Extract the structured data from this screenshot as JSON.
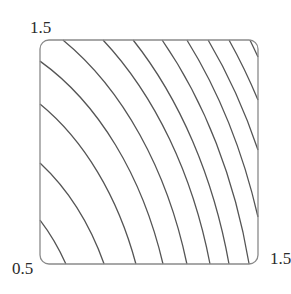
{
  "chart_data": {
    "type": "contour",
    "title": "",
    "xlabel": "",
    "ylabel": "",
    "xlim": [
      0.5,
      1.5
    ],
    "ylim": [
      0.5,
      1.5
    ],
    "tick_labels": {
      "y_top": "1.5",
      "origin": "0.5",
      "x_right": "1.5"
    },
    "grid": false,
    "legend": null,
    "frame": {
      "rounded_corners": true,
      "stroke": "#8a8a8a"
    },
    "contour_color": "#555555",
    "contour_count": 12,
    "contours_data_endpoints": [
      {
        "from": [
          0.5,
          0.696
        ],
        "to": [
          0.619,
          0.5
        ]
      },
      {
        "from": [
          0.5,
          0.951
        ],
        "to": [
          0.794,
          0.5
        ]
      },
      {
        "from": [
          0.5,
          1.214
        ],
        "to": [
          0.94,
          0.5
        ]
      },
      {
        "from": [
          0.5,
          1.406
        ],
        "to": [
          1.064,
          0.5
        ]
      },
      {
        "from": [
          0.605,
          1.5
        ],
        "to": [
          1.174,
          0.5
        ]
      },
      {
        "from": [
          0.789,
          1.5
        ],
        "to": [
          1.28,
          0.5
        ]
      },
      {
        "from": [
          0.927,
          1.5
        ],
        "to": [
          1.367,
          0.5
        ]
      },
      {
        "from": [
          1.06,
          1.5
        ],
        "to": [
          1.459,
          0.5
        ]
      },
      {
        "from": [
          1.174,
          1.5
        ],
        "to": [
          1.5,
          0.71
        ]
      },
      {
        "from": [
          1.271,
          1.5
        ],
        "to": [
          1.5,
          1.009
        ]
      },
      {
        "from": [
          1.367,
          1.5
        ],
        "to": [
          1.5,
          1.232
        ]
      },
      {
        "from": [
          1.463,
          1.5
        ],
        "to": [
          1.5,
          1.424
        ]
      }
    ]
  },
  "plot": {
    "box_px": {
      "left": 40,
      "top": 40,
      "right": 258,
      "bottom": 264,
      "radius": 9
    },
    "center_data": [
      0.0,
      0.0
    ]
  }
}
